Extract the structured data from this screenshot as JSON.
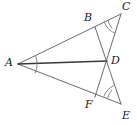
{
  "figure": {
    "background_color": "#ffffff",
    "stroke_color": "#5a5a5a",
    "strong_stroke_color": "#3a3a3a",
    "label_color": "#1a1a1a",
    "width": 137,
    "height": 125,
    "vertices": [
      {
        "id": "A",
        "label": "A",
        "x": 18,
        "y": 64,
        "label_x": 5,
        "label_y": 57
      },
      {
        "id": "B",
        "label": "B",
        "x": 95,
        "y": 27,
        "label_x": 84,
        "label_y": 12
      },
      {
        "id": "C",
        "label": "C",
        "x": 121,
        "y": 14,
        "label_x": 122,
        "label_y": 1
      },
      {
        "id": "D",
        "label": "D",
        "x": 107,
        "y": 61,
        "label_x": 111,
        "label_y": 55
      },
      {
        "id": "E",
        "label": "E",
        "x": 121,
        "y": 104,
        "label_x": 122,
        "label_y": 110
      },
      {
        "id": "F",
        "label": "F",
        "x": 95,
        "y": 97,
        "label_x": 85,
        "label_y": 99
      }
    ],
    "segments": [
      {
        "id": "AC",
        "from": "A",
        "to": "C",
        "style": "normal"
      },
      {
        "id": "AE",
        "from": "A",
        "to": "E",
        "style": "normal"
      },
      {
        "id": "AD",
        "from": "A",
        "to": "D",
        "style": "strong"
      },
      {
        "id": "BE",
        "from": "B",
        "to": "E",
        "style": "normal"
      },
      {
        "id": "FC",
        "from": "F",
        "to": "C",
        "style": "normal"
      }
    ],
    "angle_marks": [
      {
        "id": "angle-A-upper",
        "vertex": "A",
        "arcs": 1,
        "note": "angle BAD"
      },
      {
        "id": "angle-A-lower",
        "vertex": "A",
        "arcs": 1,
        "note": "angle DAF"
      },
      {
        "id": "angle-C",
        "vertex": "C",
        "arcs": 2,
        "note": "angle BCF, double arc"
      },
      {
        "id": "angle-E",
        "vertex": "E",
        "arcs": 2,
        "note": "angle FEB, double arc"
      }
    ]
  }
}
